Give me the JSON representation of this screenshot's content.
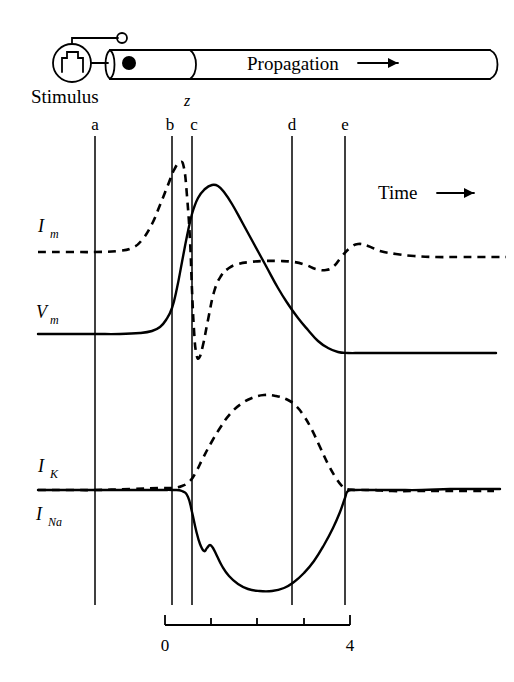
{
  "figure": {
    "title_alt": "Propagating action potential and membrane currents along an axon",
    "diagram": {
      "stimulus_label": "Stimulus",
      "propagation_label": "Propagation",
      "propagation_arrow": "arrow-right-icon",
      "position_label": "z",
      "stimulus_source_icon": "pulse-generator-icon",
      "reference_electrode_icon": "open-circle-electrode-icon",
      "recording_electrode_icon": "filled-dot-electrode-icon"
    },
    "time_axis": {
      "label": "Time",
      "arrow": "arrow-right-icon",
      "start_tick_label": "0",
      "end_tick_label": "4",
      "ticks": [
        0,
        1,
        2,
        3,
        4
      ],
      "tick_x": [
        165,
        211,
        257,
        304,
        350
      ]
    },
    "markers": [
      {
        "label": "a",
        "x": 95
      },
      {
        "label": "b",
        "x": 172
      },
      {
        "label": "c",
        "x": 192
      },
      {
        "label": "d",
        "x": 292
      },
      {
        "label": "e",
        "x": 345
      }
    ],
    "trace_labels": [
      {
        "base": "I",
        "sub": "m",
        "x": 38,
        "y": 232,
        "style": "dashed"
      },
      {
        "base": "V",
        "sub": "m",
        "x": 36,
        "y": 318,
        "style": "solid"
      },
      {
        "base": "I",
        "sub": "K",
        "x": 38,
        "y": 472,
        "style": "dashed"
      },
      {
        "base": "I",
        "sub": "Na",
        "x": 36,
        "y": 520,
        "style": "solid"
      }
    ]
  },
  "chart_data": {
    "type": "line",
    "xlabel": "Time",
    "ylabel": "",
    "xlim": [
      0,
      4
    ],
    "grid": false,
    "legend": "none",
    "annotations": [
      "a",
      "b",
      "c",
      "d",
      "e",
      "z",
      "Stimulus",
      "Propagation",
      "Time"
    ],
    "vertical_markers": {
      "a": 0.0,
      "b": 1.68,
      "c": 2.11,
      "d": 4.28,
      "e": 5.43
    },
    "series": [
      {
        "name": "I_m",
        "style": "dashed",
        "baseline_y": 252,
        "points_px": [
          [
            38,
            252
          ],
          [
            70,
            252
          ],
          [
            95,
            252
          ],
          [
            118,
            251
          ],
          [
            132,
            248
          ],
          [
            142,
            240
          ],
          [
            152,
            224
          ],
          [
            160,
            205
          ],
          [
            168,
            185
          ],
          [
            174,
            170
          ],
          [
            180,
            162
          ],
          [
            184,
            168
          ],
          [
            187,
            196
          ],
          [
            190,
            240
          ],
          [
            192,
            290
          ],
          [
            194,
            330
          ],
          [
            196,
            352
          ],
          [
            199,
            358
          ],
          [
            203,
            345
          ],
          [
            208,
            320
          ],
          [
            214,
            292
          ],
          [
            221,
            276
          ],
          [
            229,
            268
          ],
          [
            238,
            264
          ],
          [
            250,
            262
          ],
          [
            264,
            261
          ],
          [
            280,
            261
          ],
          [
            294,
            262
          ],
          [
            306,
            265
          ],
          [
            316,
            269
          ],
          [
            326,
            270
          ],
          [
            334,
            266
          ],
          [
            342,
            256
          ],
          [
            350,
            248
          ],
          [
            358,
            244
          ],
          [
            368,
            246
          ],
          [
            380,
            251
          ],
          [
            396,
            254
          ],
          [
            414,
            256
          ],
          [
            436,
            257
          ],
          [
            460,
            257
          ],
          [
            484,
            257
          ],
          [
            506,
            257
          ]
        ]
      },
      {
        "name": "V_m",
        "style": "solid",
        "baseline_y": 334,
        "points_px": [
          [
            38,
            334
          ],
          [
            70,
            334
          ],
          [
            95,
            334
          ],
          [
            120,
            334
          ],
          [
            140,
            333
          ],
          [
            152,
            331
          ],
          [
            160,
            327
          ],
          [
            166,
            320
          ],
          [
            172,
            308
          ],
          [
            177,
            288
          ],
          [
            182,
            262
          ],
          [
            187,
            236
          ],
          [
            192,
            214
          ],
          [
            198,
            198
          ],
          [
            205,
            189
          ],
          [
            212,
            185
          ],
          [
            218,
            186
          ],
          [
            224,
            192
          ],
          [
            232,
            204
          ],
          [
            242,
            222
          ],
          [
            254,
            244
          ],
          [
            266,
            266
          ],
          [
            278,
            288
          ],
          [
            288,
            304
          ],
          [
            298,
            318
          ],
          [
            308,
            330
          ],
          [
            318,
            341
          ],
          [
            328,
            348
          ],
          [
            338,
            352
          ],
          [
            348,
            353
          ],
          [
            362,
            353
          ],
          [
            384,
            353
          ],
          [
            410,
            353
          ],
          [
            440,
            353
          ],
          [
            470,
            353
          ],
          [
            496,
            353
          ]
        ]
      },
      {
        "name": "I_K",
        "style": "dashed",
        "baseline_y": 490,
        "points_px": [
          [
            38,
            490
          ],
          [
            70,
            490
          ],
          [
            95,
            490
          ],
          [
            130,
            489
          ],
          [
            158,
            488
          ],
          [
            172,
            488
          ],
          [
            182,
            486
          ],
          [
            190,
            481
          ],
          [
            196,
            472
          ],
          [
            203,
            458
          ],
          [
            211,
            443
          ],
          [
            220,
            428
          ],
          [
            230,
            414
          ],
          [
            241,
            404
          ],
          [
            252,
            398
          ],
          [
            264,
            395
          ],
          [
            276,
            396
          ],
          [
            288,
            400
          ],
          [
            296,
            406
          ],
          [
            304,
            416
          ],
          [
            312,
            430
          ],
          [
            320,
            447
          ],
          [
            328,
            464
          ],
          [
            336,
            478
          ],
          [
            342,
            486
          ],
          [
            346,
            489
          ],
          [
            356,
            490
          ],
          [
            372,
            490
          ],
          [
            392,
            491
          ],
          [
            414,
            491
          ],
          [
            440,
            491
          ],
          [
            468,
            491
          ],
          [
            494,
            491
          ]
        ]
      },
      {
        "name": "I_Na",
        "style": "solid",
        "baseline_y": 490,
        "points_px": [
          [
            38,
            490
          ],
          [
            70,
            490
          ],
          [
            95,
            490
          ],
          [
            130,
            490
          ],
          [
            160,
            490
          ],
          [
            172,
            490
          ],
          [
            182,
            491
          ],
          [
            188,
            497
          ],
          [
            192,
            512
          ],
          [
            196,
            530
          ],
          [
            200,
            544
          ],
          [
            204,
            551
          ],
          [
            207,
            548
          ],
          [
            210,
            545
          ],
          [
            213,
            548
          ],
          [
            217,
            556
          ],
          [
            222,
            566
          ],
          [
            229,
            576
          ],
          [
            238,
            584
          ],
          [
            248,
            589
          ],
          [
            259,
            591
          ],
          [
            272,
            591
          ],
          [
            284,
            588
          ],
          [
            294,
            582
          ],
          [
            304,
            573
          ],
          [
            314,
            561
          ],
          [
            324,
            545
          ],
          [
            333,
            528
          ],
          [
            340,
            512
          ],
          [
            345,
            498
          ],
          [
            348,
            491
          ],
          [
            356,
            490
          ],
          [
            374,
            490
          ],
          [
            396,
            490
          ],
          [
            422,
            490
          ],
          [
            450,
            489
          ],
          [
            476,
            489
          ],
          [
            500,
            489
          ]
        ]
      }
    ]
  }
}
